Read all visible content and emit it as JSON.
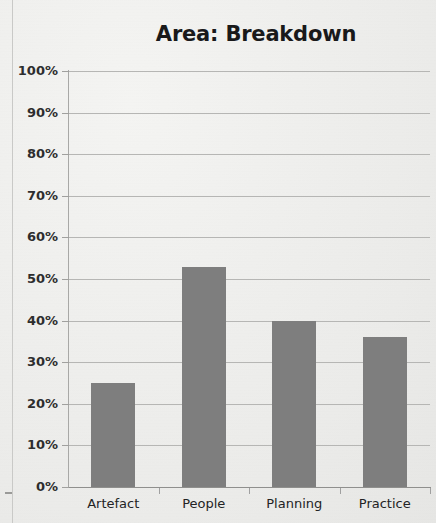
{
  "chart_data": {
    "type": "bar",
    "title": "Area: Breakdown",
    "xlabel": "",
    "ylabel": "",
    "categories": [
      "Artefact",
      "People",
      "Planning",
      "Practice"
    ],
    "values": [
      25,
      53,
      40,
      36
    ],
    "value_labels": [
      "25%",
      "53%",
      "40%",
      "36%"
    ],
    "ylim": [
      0,
      100
    ],
    "ytick_values": [
      100,
      90,
      80,
      70,
      60,
      50,
      40,
      30,
      20,
      10,
      0
    ],
    "ytick_labels": [
      "100%",
      "90%",
      "80%",
      "70%",
      "60%",
      "50%",
      "40%",
      "30%",
      "20%",
      "10%",
      "0%"
    ],
    "grid": true,
    "legend": "none",
    "bar_color": "#7e7e7e",
    "gridline_color": "#b6b6b4",
    "axis_color": "#8f8f8d",
    "text_color": "#232324",
    "background_color": "#f1f1ef"
  }
}
